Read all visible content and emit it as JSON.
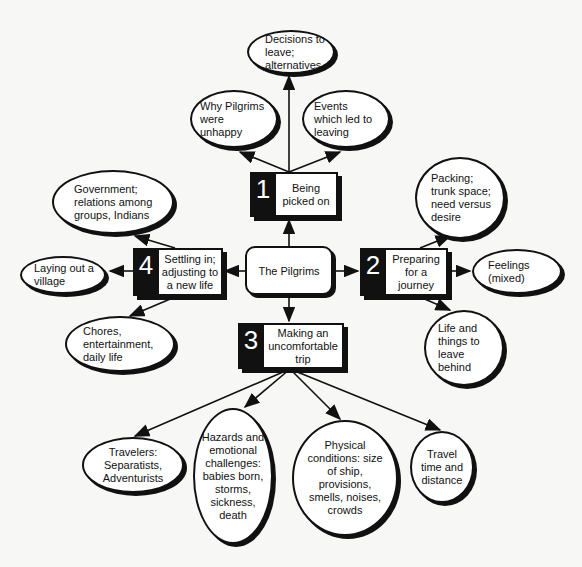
{
  "diagram": {
    "center": {
      "label": "The Pilgrims"
    },
    "steps": [
      {
        "number": "1",
        "label": "Being\npicked on",
        "children": [
          "Decisions to\nleave;\nalternatives",
          "Why Pilgrims\nwere\nunhappy",
          "Events\nwhich led to\nleaving"
        ]
      },
      {
        "number": "2",
        "label": "Preparing\nfor a\njourney",
        "children": [
          "Packing;\ntrunk space;\nneed versus\ndesire",
          "Feelings\n(mixed)",
          "Life and\nthings to\nleave\nbehind"
        ]
      },
      {
        "number": "3",
        "label": "Making an\nuncomfortable\ntrip",
        "children": [
          "Travelers:\nSeparatists,\nAdventurists",
          "Hazards and\nemotional\nchallenges:\nbabies born,\nstorms,\nsickness,\ndeath",
          "Physical\nconditions: size\nof ship,\nprovisions,\nsmells,  noises,\ncrowds",
          "Travel\ntime and\ndistance"
        ]
      },
      {
        "number": "4",
        "label": "Settling in;\nadjusting to\na new life",
        "children": [
          "Government;\nrelations  among\ngroups, Indians",
          "Laying out a\nvillage",
          "Chores,\nentertainment,\ndaily life"
        ]
      }
    ]
  }
}
